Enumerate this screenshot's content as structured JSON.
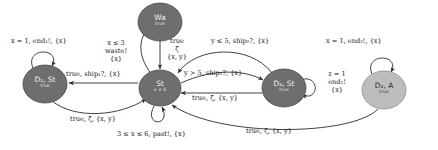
{
  "figure": {
    "type": "timed-automaton-state-diagram",
    "title": "",
    "background": "#ffffff"
  },
  "colors": {
    "node_dark": "#6e6e6e",
    "node_light": "#bdbdbd",
    "node_stroke": "#4a4a4a",
    "edge": "#2a2a2a",
    "label_text": "#171717",
    "node_text_light": "#f2f2f2",
    "node_text_dark": "#2a2a2a"
  },
  "nodes": [
    {
      "id": "wa",
      "label": "Wa",
      "invariant": "true",
      "shade": "dark",
      "cx": 160,
      "cy": 22,
      "rx": 22,
      "ry": 19
    },
    {
      "id": "d1st",
      "label": "D₁, St",
      "invariant": "true",
      "shade": "dark",
      "cx": 45,
      "cy": 84,
      "rx": 22,
      "ry": 19
    },
    {
      "id": "st",
      "label": "St",
      "invariant": "x ≤ 6",
      "shade": "dark",
      "cx": 160,
      "cy": 88,
      "rx": 21,
      "ry": 18
    },
    {
      "id": "d2st",
      "label": "D₂, St",
      "invariant": "true",
      "shade": "dark",
      "cx": 284,
      "cy": 88,
      "rx": 22,
      "ry": 19
    },
    {
      "id": "d2a",
      "label": "D₂, A",
      "invariant": "true",
      "shade": "light",
      "cx": 384,
      "cy": 90,
      "rx": 22,
      "ry": 19
    }
  ],
  "edges": [
    {
      "id": "e-d1st-self",
      "from": "d1st",
      "to": "d1st",
      "kind": "self-loop-top",
      "label_lines": [
        "x = 1, end₁!, {x}"
      ],
      "label_x": 11,
      "label_y": 38
    },
    {
      "id": "e-st-wa",
      "from": "st",
      "to": "wa",
      "kind": "curve-up-left",
      "label_lines": [
        "x ≤ 3",
        "waste!",
        "{x}"
      ],
      "label_x": 101,
      "label_y": 40
    },
    {
      "id": "e-wa-st",
      "from": "wa",
      "to": "st",
      "kind": "straight-down",
      "label_lines": [
        "true",
        "ζ",
        "{x, y}"
      ],
      "label_x": 163,
      "label_y": 38
    },
    {
      "id": "e-d2st-st-top",
      "from": "d2st",
      "to": "st",
      "kind": "arc-over-right",
      "label_lines": [
        "y ≤ 5, ship₂?, {x}"
      ],
      "label_x": 211,
      "label_y": 38
    },
    {
      "id": "e-d2a-self",
      "from": "d2a",
      "to": "d2a",
      "kind": "self-loop-top",
      "label_lines": [
        "x = 1, end₂!, {x}"
      ],
      "label_x": 326,
      "label_y": 38
    },
    {
      "id": "e-st-d1st",
      "from": "st",
      "to": "d1st",
      "kind": "straight-left",
      "label_lines": [
        "true, ship₁?, {x}"
      ],
      "label_x": 66,
      "label_y": 71
    },
    {
      "id": "e-st-d2st",
      "from": "st",
      "to": "d2st",
      "kind": "arc-right-upper",
      "label_lines": [
        "y > 5, ship₂?, {x}"
      ],
      "label_x": 184,
      "label_y": 70
    },
    {
      "id": "e-d2st-st",
      "from": "d2st",
      "to": "st",
      "kind": "straight-left-lower",
      "label_lines": [
        "true, ζ, {x, y}"
      ],
      "label_x": 192,
      "label_y": 88
    },
    {
      "id": "e-d2st-self",
      "from": "d2st",
      "to": "d2st",
      "kind": "self-loop-right",
      "label_lines": [
        "z = 1",
        "end₂!",
        "{x}"
      ],
      "label_x": 323,
      "label_y": 71
    },
    {
      "id": "e-d1st-st",
      "from": "d1st",
      "to": "st",
      "kind": "arc-bottom-left",
      "label_lines": [
        "true, ζ, {x, y}"
      ],
      "label_x": 70,
      "label_y": 116
    },
    {
      "id": "e-st-self",
      "from": "st",
      "to": "st",
      "kind": "self-loop-bottom",
      "label_lines": [
        "3 ≤ x ≤ 6, past!, {x}"
      ],
      "label_x": 117,
      "label_y": 131
    },
    {
      "id": "e-d2a-st",
      "from": "d2a",
      "to": "st",
      "kind": "arc-bottom-right",
      "label_lines": [
        "true, ζ, {x, y}"
      ],
      "label_x": 246,
      "label_y": 128
    }
  ]
}
